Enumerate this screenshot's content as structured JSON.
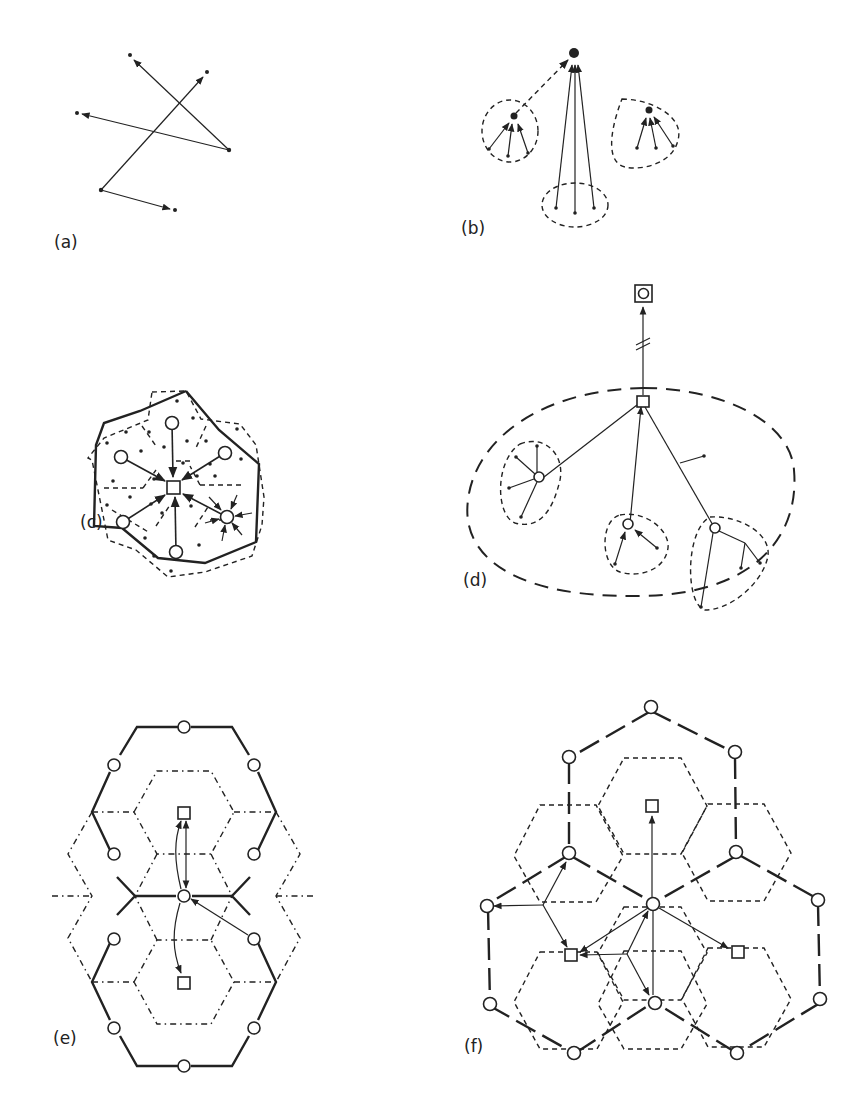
{
  "figure": {
    "panels": [
      {
        "id": "a",
        "label": "(a)"
      },
      {
        "id": "b",
        "label": "(b)"
      },
      {
        "id": "c",
        "label": "(c)"
      },
      {
        "id": "d",
        "label": "(d)"
      },
      {
        "id": "e",
        "label": "(e)"
      },
      {
        "id": "f",
        "label": "(f)"
      }
    ],
    "legend_symbols": {
      "dot": "point / demand location",
      "circle": "intermediate center",
      "square": "higher-order center",
      "boxed_circle": "top-level center"
    },
    "colors": {
      "ink": "#222222",
      "background": "#ffffff"
    }
  }
}
